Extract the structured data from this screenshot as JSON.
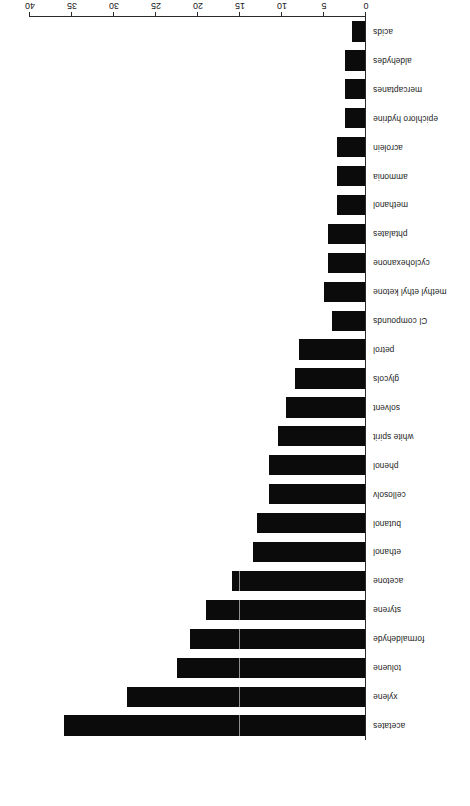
{
  "chart_data": {
    "type": "bar",
    "orientation": "horizontal",
    "title": "",
    "xlabel": "Relative frequency, %",
    "ylabel": "",
    "xlim": [
      0,
      40
    ],
    "xticks": [
      0,
      5,
      10,
      15,
      20,
      25,
      30,
      35,
      40
    ],
    "grid": false,
    "bar_color": "#0b0b0b",
    "rotation_note": "Figure is printed upside down (rotated 180 degrees)",
    "categories": [
      "acetates",
      "xylene",
      "toluene",
      "formaldehyde",
      "styrene",
      "acetone",
      "ethanol",
      "butanol",
      "cellosolv",
      "phenol",
      "white spirit",
      "solvent",
      "glycols",
      "petrol",
      "Cl compounds",
      "methyl ethyl ketone",
      "cyclohexanone",
      "phtalates",
      "methanol",
      "ammonia",
      "acrolein",
      "epichloro hydrine",
      "mercaptanes",
      "aldehydes",
      "acids"
    ],
    "values": [
      36,
      28.5,
      22.5,
      21,
      19,
      16,
      13.5,
      13,
      11.5,
      11.5,
      10.5,
      9.5,
      8.5,
      8,
      4,
      5,
      4.5,
      4.5,
      3.5,
      3.5,
      3.5,
      2.5,
      2.5,
      2.5,
      1.7
    ]
  },
  "axis": {
    "value_axis_title": "Relative frequency, %",
    "tick_labels": [
      "0",
      "5",
      "10",
      "15",
      "20",
      "25",
      "30",
      "35",
      "40"
    ]
  }
}
